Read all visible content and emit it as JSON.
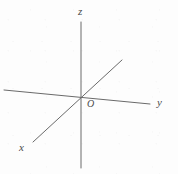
{
  "figure": {
    "kind": "3d-coordinate-axes-diagram",
    "width": 178,
    "height": 174,
    "background_color": "#fdfdfd",
    "line_color": "#6a6a6a",
    "label_color": "#4a4a4a",
    "line_width": 1
  },
  "origin": {
    "label": "O",
    "x": 81,
    "y": 96
  },
  "axes": [
    {
      "name": "z-axis",
      "label": "z",
      "orientation": "vertical",
      "x1": 81,
      "y1": 22,
      "x2": 81,
      "y2": 168,
      "label_x": 83,
      "label_y": 12
    },
    {
      "name": "y-axis",
      "label": "y",
      "orientation": "horizontal-tilted",
      "x1": 4,
      "y1": 90,
      "x2": 150,
      "y2": 104,
      "label_x": 160,
      "label_y": 103
    },
    {
      "name": "x-axis",
      "label": "x",
      "orientation": "diagonal",
      "x1": 33,
      "y1": 142,
      "x2": 122,
      "y2": 60,
      "label_x": 24,
      "label_y": 148
    }
  ]
}
